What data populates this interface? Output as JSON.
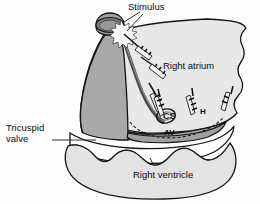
{
  "figure": {
    "name": "right-atrium-electrophysiology-diagram",
    "background_color": "#fdfdfd"
  },
  "colors": {
    "outline": "#141414",
    "atrium_light_fill": "#e8e8e8",
    "atrium_dark_fill": "#a9a9a9",
    "crista_band": "#6d6d6d",
    "ventricle_fill": "#e3e3e3",
    "valve_fill": "#ffffff",
    "svc_lumen": "#8d8d8d",
    "stimulus_burst": "#fbfbfb",
    "catheter": "#111111",
    "text": "#0d0d0d"
  },
  "labels": {
    "stimulus": "Stimulus",
    "right_atrium": "Right atrium",
    "tricuspid_valve_line1": "Tricuspid",
    "tricuspid_valve_line2": "valve",
    "right_ventricle": "Right ventricle",
    "coronary_sinus": "CS",
    "his_bundle": "H",
    "av_node": "AV"
  },
  "structures": [
    {
      "id": "svc",
      "name": "superior-vena-cava-stump"
    },
    {
      "id": "right-atrium-wall",
      "name": "right-atrium-free-wall"
    },
    {
      "id": "posterior-atrial-wall",
      "name": "posterior-atrial-wall-shaded"
    },
    {
      "id": "crista-terminalis",
      "name": "crista-terminalis-band"
    },
    {
      "id": "tricuspid-annulus",
      "name": "tricuspid-annulus-dashed-arc"
    },
    {
      "id": "tricuspid-leaflets",
      "name": "tricuspid-valve-leaflets"
    },
    {
      "id": "right-ventricle-wall",
      "name": "right-ventricle-chamber"
    },
    {
      "id": "coronary-sinus-os",
      "name": "coronary-sinus-ostium"
    },
    {
      "id": "stimulus-burst",
      "name": "stimulus-burst-marker"
    }
  ],
  "catheters": [
    {
      "id": "cath-svc",
      "name": "catheter-electrode-svc"
    },
    {
      "id": "cath-high-ra",
      "name": "catheter-electrode-high-right-atrium"
    },
    {
      "id": "cath-mid-ra",
      "name": "catheter-electrode-mid-right-atrium"
    },
    {
      "id": "cath-cs",
      "name": "catheter-electrode-coronary-sinus"
    },
    {
      "id": "cath-his",
      "name": "catheter-electrode-his-bundle"
    },
    {
      "id": "cath-lateral",
      "name": "catheter-electrode-lateral-annulus"
    }
  ]
}
